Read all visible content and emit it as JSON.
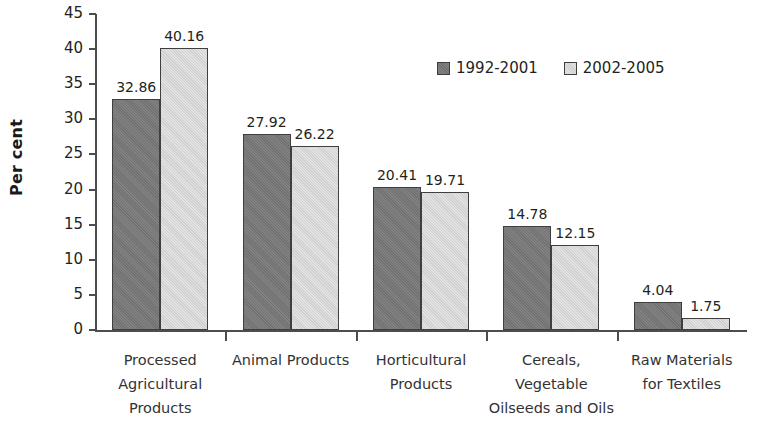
{
  "chart_data": {
    "type": "bar",
    "title": "",
    "subtitle": "",
    "xlabel": "",
    "ylabel": "Per cent",
    "ylim": [
      0,
      45
    ],
    "ytick_step": 5,
    "yticks": [
      "45",
      "40",
      "35",
      "30",
      "25",
      "20",
      "15",
      "10",
      "5",
      "0"
    ],
    "grid": false,
    "legend_position": "top-center",
    "categories": [
      "Processed Agricultural Products",
      "Animal Products",
      "Horticultural Products",
      "Cereals, Vegetable Oilseeds and Oils",
      "Raw Materials for Textiles"
    ],
    "category_label_lines": [
      [
        "Processed",
        "Agricultural",
        "Products"
      ],
      [
        "Animal Products"
      ],
      [
        "Horticultural",
        "Products"
      ],
      [
        "Cereals,",
        "Vegetable",
        "Oilseeds and Oils"
      ],
      [
        "Raw Materials",
        "for Textiles"
      ]
    ],
    "series": [
      {
        "name": "1992-2001",
        "color": "#787878",
        "values": [
          32.86,
          27.92,
          20.41,
          14.78,
          4.04
        ],
        "value_labels": [
          "32.86",
          "27.92",
          "20.41",
          "14.78",
          "4.04"
        ]
      },
      {
        "name": "2002-2005",
        "color": "#d9d9d9",
        "values": [
          40.16,
          26.22,
          19.71,
          12.15,
          1.75
        ],
        "value_labels": [
          "40.16",
          "26.22",
          "19.71",
          "12.15",
          "1.75"
        ]
      }
    ]
  },
  "legend": {
    "items": [
      {
        "label": "1992-2001"
      },
      {
        "label": "2002-2005"
      }
    ]
  },
  "axes": {
    "y_title": "Per cent"
  }
}
